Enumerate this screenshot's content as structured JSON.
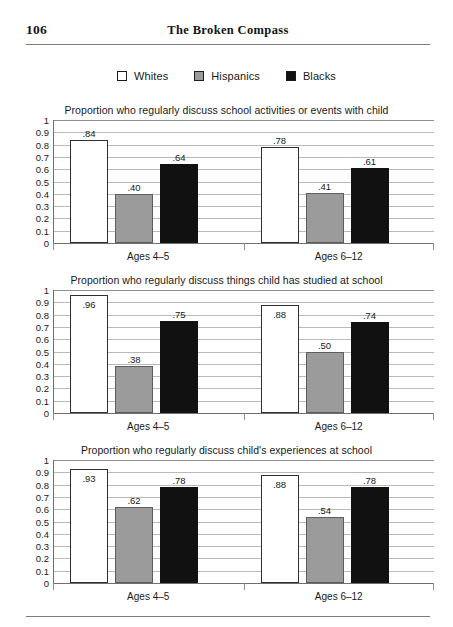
{
  "page": {
    "folio": "106",
    "running_title": "The Broken Compass"
  },
  "legend": {
    "items": [
      {
        "label": "Whites",
        "color": "#ffffff",
        "swatch": "legend-swatch-whites"
      },
      {
        "label": "Hispanics",
        "color": "#9b9b9b",
        "swatch": "legend-swatch-hispanics"
      },
      {
        "label": "Blacks",
        "color": "#111111",
        "swatch": "legend-swatch-blacks"
      }
    ]
  },
  "chart_data": [
    {
      "type": "bar",
      "title": "Proportion who regularly discuss school activities or events with child",
      "categories": [
        "Ages 4–5",
        "Ages 6–12"
      ],
      "series": [
        {
          "name": "Whites",
          "values": [
            0.84,
            0.78
          ],
          "labels": [
            ".84",
            ".78"
          ]
        },
        {
          "name": "Hispanics",
          "values": [
            0.4,
            0.41
          ],
          "labels": [
            ".40",
            ".41"
          ]
        },
        {
          "name": "Blacks",
          "values": [
            0.64,
            0.61
          ],
          "labels": [
            ".64",
            ".61"
          ]
        }
      ],
      "xlabel": "",
      "ylabel": "",
      "ylim": [
        0,
        1
      ],
      "yticks": [
        "0",
        "0.1",
        "0.2",
        "0.3",
        "0.4",
        "0.5",
        "0.6",
        "0.7",
        "0.8",
        "0.9",
        "1"
      ],
      "grid": true,
      "legend_position": "top"
    },
    {
      "type": "bar",
      "title": "Proportion who regularly discuss things child has studied at school",
      "categories": [
        "Ages 4–5",
        "Ages 6–12"
      ],
      "series": [
        {
          "name": "Whites",
          "values": [
            0.96,
            0.88
          ],
          "labels": [
            ".96",
            ".88"
          ]
        },
        {
          "name": "Hispanics",
          "values": [
            0.38,
            0.5
          ],
          "labels": [
            ".38",
            ".50"
          ]
        },
        {
          "name": "Blacks",
          "values": [
            0.75,
            0.74
          ],
          "labels": [
            ".75",
            ".74"
          ]
        }
      ],
      "xlabel": "",
      "ylabel": "",
      "ylim": [
        0,
        1
      ],
      "yticks": [
        "0",
        "0.1",
        "0.2",
        "0.3",
        "0.4",
        "0.5",
        "0.6",
        "0.7",
        "0.8",
        "0.9",
        "1"
      ],
      "grid": true,
      "legend_position": "top"
    },
    {
      "type": "bar",
      "title": "Proportion who regularly discuss child's experiences at school",
      "categories": [
        "Ages 4–5",
        "Ages 6–12"
      ],
      "series": [
        {
          "name": "Whites",
          "values": [
            0.93,
            0.88
          ],
          "labels": [
            ".93",
            ".88"
          ]
        },
        {
          "name": "Hispanics",
          "values": [
            0.62,
            0.54
          ],
          "labels": [
            ".62",
            ".54"
          ]
        },
        {
          "name": "Blacks",
          "values": [
            0.78,
            0.78
          ],
          "labels": [
            ".78",
            ".78"
          ]
        }
      ],
      "xlabel": "",
      "ylabel": "",
      "ylim": [
        0,
        1
      ],
      "yticks": [
        "0",
        "0.1",
        "0.2",
        "0.3",
        "0.4",
        "0.5",
        "0.6",
        "0.7",
        "0.8",
        "0.9",
        "1"
      ],
      "grid": true,
      "legend_position": "top"
    }
  ]
}
